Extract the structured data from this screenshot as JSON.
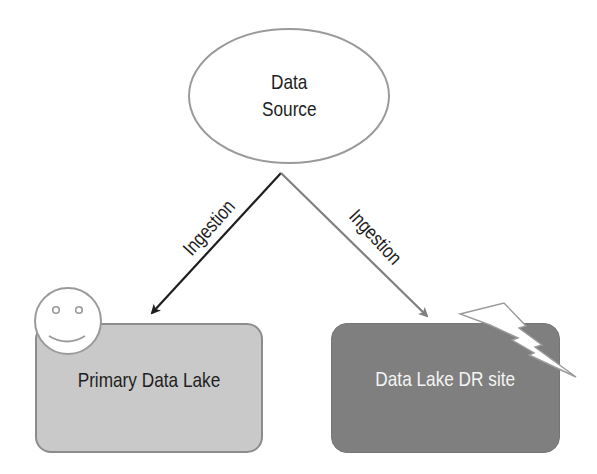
{
  "diagram": {
    "type": "data-lake-disaster-recovery",
    "nodes": {
      "source": {
        "label_line1": "Data",
        "label_line2": "Source",
        "shape": "ellipse"
      },
      "primary": {
        "label": "Primary Data Lake",
        "shape": "rounded-rectangle",
        "status_icon": "smiley-icon"
      },
      "dr_site": {
        "label": "Data Lake DR site",
        "shape": "rounded-rectangle",
        "status_icon": "lightning-bolt-icon"
      }
    },
    "edges": [
      {
        "from": "source",
        "to": "primary",
        "label": "Ingestion"
      },
      {
        "from": "source",
        "to": "dr_site",
        "label": "Ingestion"
      }
    ],
    "colors": {
      "background": "#ffffff",
      "ellipse_fill": "#ffffff",
      "ellipse_stroke": "#9a9a9a",
      "primary_fill": "#c9c9c9",
      "primary_stroke": "#8c8c8c",
      "dr_fill": "#7f7f7f",
      "dr_text": "#f4f4f4",
      "arrow_primary": "#1e1e1e",
      "arrow_dr": "#808080",
      "text": "#1e1e1e"
    }
  }
}
